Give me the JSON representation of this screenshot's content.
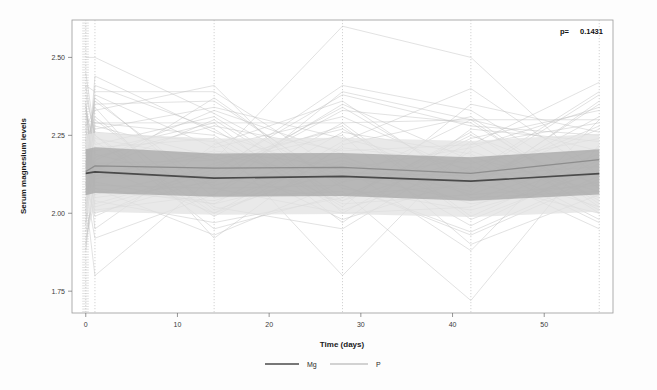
{
  "figure": {
    "background_color": "#fdfdfd",
    "panel_border_color": "#9a9a9a"
  },
  "annotation": {
    "pvalue_label": "p=",
    "pvalue_value": "0.1431"
  },
  "legend": {
    "position": "bottom-center",
    "entries": [
      {
        "label": "Mg",
        "color": "#4a4a4a"
      },
      {
        "label": "P",
        "color": "#a8a8a8"
      }
    ]
  },
  "chart_data": {
    "type": "line",
    "title": "",
    "subtitle": "",
    "xlabel": "Time (days)",
    "ylabel": "Serum magnesium levels",
    "xlim": [
      -1.5,
      57.5
    ],
    "ylim": [
      1.68,
      2.62
    ],
    "xticks": [
      0,
      10,
      20,
      30,
      40,
      50
    ],
    "xtick_labels": [
      "0",
      "10",
      "20",
      "30",
      "40",
      "50"
    ],
    "yticks": [
      1.75,
      2.0,
      2.25,
      2.5
    ],
    "ytick_labels": [
      "1.75",
      "2.00",
      "2.25",
      "2.50"
    ],
    "grid": "vertical dotted gridlines at measurement days",
    "gridline_days": [
      0,
      1,
      14,
      28,
      42,
      56
    ],
    "measurement_days": [
      0,
      1,
      14,
      28,
      42,
      56
    ],
    "annotations": [
      {
        "text": "p=  0.1431",
        "x": 54,
        "y": 2.58
      }
    ],
    "series": [
      {
        "name": "Mg",
        "kind": "mean-line",
        "color": "#4a4a4a",
        "x": [
          0,
          1,
          14,
          28,
          42,
          56
        ],
        "values": [
          2.128,
          2.133,
          2.113,
          2.118,
          2.103,
          2.127
        ]
      },
      {
        "name": "P",
        "kind": "mean-line",
        "color": "#8d8d8d",
        "x": [
          0,
          1,
          14,
          28,
          42,
          56
        ],
        "values": [
          2.134,
          2.152,
          2.145,
          2.147,
          2.128,
          2.172
        ]
      },
      {
        "name": "Mg confidence band",
        "kind": "band",
        "color": "#a6a6a6",
        "x": [
          0,
          1,
          14,
          28,
          42,
          56
        ],
        "lower": [
          2.058,
          2.065,
          2.053,
          2.055,
          2.04,
          2.06
        ],
        "upper": [
          2.205,
          2.212,
          2.192,
          2.193,
          2.18,
          2.205
        ]
      },
      {
        "name": "P confidence band",
        "kind": "band",
        "color": "#e2e2e2",
        "x": [
          0,
          1,
          14,
          28,
          42,
          56
        ],
        "lower": [
          2.0,
          2.005,
          1.995,
          1.998,
          1.988,
          2.005
        ],
        "upper": [
          2.252,
          2.258,
          2.24,
          2.242,
          2.232,
          2.255
        ]
      },
      {
        "name": "individual subject trajectories",
        "kind": "spaghetti",
        "color": "#c0c0c0",
        "x": [
          0,
          1,
          14,
          28,
          42,
          56
        ],
        "subjects": [
          [
            2.5,
            2.5,
            2.32,
            2.1,
            2.3,
            2.2
          ],
          [
            2.41,
            2.39,
            2.39,
            2.13,
            2.12,
            2.38
          ],
          [
            2.3,
            2.29,
            2.29,
            2.29,
            2.3,
            2.3
          ],
          [
            2.22,
            2.08,
            1.93,
            2.1,
            2.18,
            2.07
          ],
          [
            2.45,
            2.25,
            2.0,
            2.23,
            2.4,
            2.12
          ],
          [
            2.18,
            2.16,
            2.17,
            2.6,
            2.5,
            2.12
          ],
          [
            2.05,
            1.8,
            2.12,
            2.34,
            2.1,
            2.0
          ],
          [
            2.11,
            2.37,
            2.05,
            2.07,
            1.72,
            2.22
          ],
          [
            1.96,
            2.21,
            2.24,
            1.8,
            2.22,
            2.42
          ],
          [
            2.28,
            2.33,
            2.41,
            2.0,
            2.02,
            2.18
          ],
          [
            2.08,
            1.92,
            2.06,
            2.39,
            2.3,
            2.02
          ],
          [
            2.33,
            2.12,
            2.2,
            2.15,
            1.88,
            2.3
          ],
          [
            2.15,
            2.27,
            2.34,
            2.24,
            2.14,
            1.95
          ],
          [
            1.92,
            2.04,
            1.97,
            2.05,
            2.24,
            2.33
          ],
          [
            2.26,
            2.19,
            2.09,
            2.18,
            2.06,
            2.09
          ],
          [
            2.02,
            2.41,
            2.27,
            2.02,
            2.35,
            2.26
          ],
          [
            2.36,
            2.06,
            2.15,
            2.28,
            1.98,
            2.14
          ],
          [
            2.12,
            2.3,
            2.02,
            1.95,
            2.2,
            2.05
          ],
          [
            2.2,
            1.95,
            2.22,
            2.36,
            2.08,
            2.35
          ],
          [
            1.88,
            2.14,
            2.3,
            2.04,
            2.26,
            2.0
          ],
          [
            2.41,
            2.23,
            1.99,
            2.21,
            2.16,
            2.24
          ],
          [
            2.09,
            2.35,
            2.36,
            2.09,
            1.93,
            2.11
          ],
          [
            2.24,
            2.0,
            2.11,
            2.33,
            2.29,
            2.04
          ],
          [
            1.99,
            2.28,
            2.18,
            1.98,
            2.11,
            2.28
          ],
          [
            2.31,
            2.1,
            2.03,
            2.26,
            2.19,
            1.98
          ],
          [
            2.06,
            2.44,
            2.26,
            2.12,
            2.04,
            2.19
          ],
          [
            2.17,
            2.02,
            2.13,
            2.41,
            2.33,
            2.08
          ],
          [
            2.38,
            2.25,
            1.95,
            2.06,
            2.09,
            2.31
          ],
          [
            2.01,
            2.17,
            2.33,
            2.19,
            1.96,
            2.16
          ],
          [
            2.27,
            2.09,
            2.08,
            2.0,
            2.23,
            2.01
          ],
          [
            2.14,
            2.38,
            2.21,
            2.31,
            2.13,
            2.39
          ],
          [
            1.94,
            2.07,
            2.04,
            2.17,
            2.03,
            2.1
          ],
          [
            2.34,
            2.2,
            2.29,
            1.97,
            2.27,
            2.23
          ],
          [
            2.1,
            1.99,
            2.16,
            2.25,
            1.9,
            2.06
          ],
          [
            2.23,
            2.31,
            2.01,
            2.14,
            2.21,
            2.34
          ],
          [
            2.03,
            2.13,
            2.37,
            2.08,
            2.01,
            2.13
          ],
          [
            2.29,
            2.05,
            2.1,
            2.35,
            2.17,
            1.97
          ],
          [
            2.16,
            2.26,
            2.23,
            2.03,
            2.06,
            2.21
          ],
          [
            1.97,
            2.34,
            1.92,
            2.22,
            2.31,
            2.03
          ],
          [
            2.21,
            2.11,
            2.19,
            2.11,
            2.1,
            2.27
          ],
          [
            2.07,
            2.01,
            2.06,
            2.29,
            1.99,
            2.17
          ],
          [
            2.32,
            2.22,
            2.31,
            2.05,
            2.25,
            2.09
          ],
          [
            2.13,
            2.15,
            2.0,
            2.16,
            2.07,
            2.36
          ],
          [
            2.0,
            2.29,
            2.25,
            2.01,
            2.15,
            2.02
          ],
          [
            2.25,
            2.03,
            2.14,
            2.38,
            2.28,
            2.25
          ],
          [
            2.19,
            2.36,
            2.08,
            2.09,
            1.94,
            2.12
          ],
          [
            2.04,
            2.18,
            2.28,
            2.2,
            2.22,
            2.29
          ],
          [
            2.35,
            2.08,
            2.03,
            2.13,
            2.12,
            2.15
          ],
          [
            2.12,
            2.24,
            2.17,
            2.27,
            2.05,
            2.07
          ],
          [
            1.9,
            2.12,
            2.12,
            2.04,
            2.18,
            2.2
          ]
        ]
      }
    ]
  }
}
